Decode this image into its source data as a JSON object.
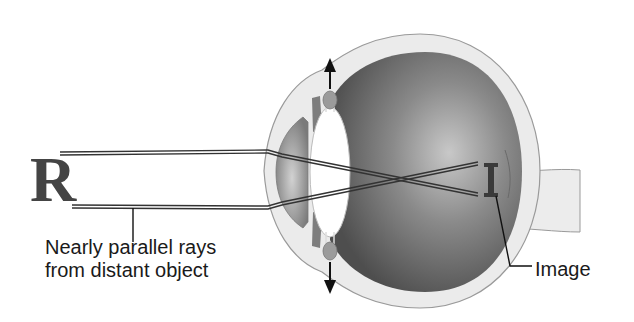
{
  "figure": {
    "object_letter": "R",
    "image_letter": "I",
    "labels": {
      "rays_line1": "Nearly parallel rays",
      "rays_line2": "from distant object",
      "image": "Image"
    },
    "parts": [
      "object-R",
      "parallel-rays",
      "cornea",
      "lens",
      "ciliary-body",
      "vitreous-body",
      "sclera",
      "retina",
      "optic-nerve",
      "inverted-image"
    ],
    "arrows": [
      "up-arrow-tension",
      "down-arrow-tension"
    ],
    "colors": {
      "sclera": "#e9e9e9",
      "sclera_outline": "#9a9a9a",
      "vitreous_dark": "#5c5c5c",
      "vitreous_light": "#bdbdbd",
      "lens": "#ffffff",
      "cornea_chamber": "#a8a8a8",
      "ciliary": "#9b9b9b",
      "ray": "#333333",
      "text": "#1a1a1a"
    }
  }
}
